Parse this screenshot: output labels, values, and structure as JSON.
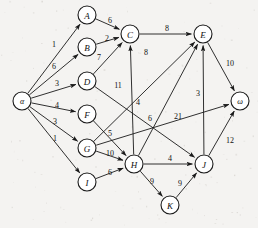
{
  "figure": {
    "background_color": "#f4f3f1",
    "ink_color": "#1a1a1a"
  },
  "chart_data": {
    "type": "diagram",
    "diagram_kind": "directed-weighted-graph",
    "title": "",
    "xlabel": "",
    "ylabel": "",
    "node_radius": 9,
    "nodes": [
      {
        "id": "alpha",
        "label": "α",
        "x": 22,
        "y": 101
      },
      {
        "id": "A",
        "label": "A",
        "x": 87,
        "y": 15
      },
      {
        "id": "B",
        "label": "B",
        "x": 87,
        "y": 47
      },
      {
        "id": "C",
        "label": "C",
        "x": 130,
        "y": 34
      },
      {
        "id": "D",
        "label": "D",
        "x": 87,
        "y": 81
      },
      {
        "id": "E",
        "label": "E",
        "x": 203,
        "y": 34
      },
      {
        "id": "F",
        "label": "F",
        "x": 87,
        "y": 114
      },
      {
        "id": "G",
        "label": "G",
        "x": 87,
        "y": 148
      },
      {
        "id": "H",
        "label": "H",
        "x": 134,
        "y": 164
      },
      {
        "id": "I",
        "label": "I",
        "x": 87,
        "y": 182
      },
      {
        "id": "J",
        "label": "J",
        "x": 204,
        "y": 164
      },
      {
        "id": "K",
        "label": "K",
        "x": 170,
        "y": 205
      },
      {
        "id": "omega",
        "label": "ω",
        "x": 240,
        "y": 101
      }
    ],
    "edges": [
      {
        "from": "alpha",
        "to": "A",
        "weight": 1,
        "label_x": 54,
        "label_y": 44
      },
      {
        "from": "alpha",
        "to": "B",
        "weight": 6,
        "label_x": 54,
        "label_y": 66
      },
      {
        "from": "alpha",
        "to": "D",
        "weight": 3,
        "label_x": 57,
        "label_y": 83
      },
      {
        "from": "alpha",
        "to": "F",
        "weight": 4,
        "label_x": 57,
        "label_y": 105
      },
      {
        "from": "alpha",
        "to": "G",
        "weight": 3,
        "label_x": 55,
        "label_y": 121
      },
      {
        "from": "alpha",
        "to": "I",
        "weight": 1,
        "label_x": 55,
        "label_y": 138
      },
      {
        "from": "A",
        "to": "C",
        "weight": 6,
        "label_x": 110,
        "label_y": 20
      },
      {
        "from": "B",
        "to": "C",
        "weight": 2,
        "label_x": 107,
        "label_y": 38
      },
      {
        "from": "D",
        "to": "C",
        "weight": 7,
        "label_x": 99,
        "label_y": 57
      },
      {
        "from": "C",
        "to": "E",
        "weight": 8,
        "label_x": 167,
        "label_y": 28
      },
      {
        "from": "G",
        "to": "E",
        "weight": 8,
        "label_x": 146,
        "label_y": 52
      },
      {
        "from": "D",
        "to": "J",
        "weight": 11,
        "label_x": 118,
        "label_y": 85
      },
      {
        "from": "H",
        "to": "C",
        "weight": 4,
        "label_x": 138,
        "label_y": 102
      },
      {
        "from": "H",
        "to": "E",
        "weight": 6,
        "label_x": 150,
        "label_y": 118
      },
      {
        "from": "G",
        "to": "omega",
        "weight": 21,
        "label_x": 178,
        "label_y": 116
      },
      {
        "from": "E",
        "to": "omega",
        "weight": 10,
        "label_x": 230,
        "label_y": 63
      },
      {
        "from": "J",
        "to": "E",
        "weight": 3,
        "label_x": 198,
        "label_y": 93
      },
      {
        "from": "J",
        "to": "omega",
        "weight": 12,
        "label_x": 230,
        "label_y": 140
      },
      {
        "from": "F",
        "to": "H",
        "weight": 5,
        "label_x": 110,
        "label_y": 133
      },
      {
        "from": "G",
        "to": "H",
        "weight": 10,
        "label_x": 110,
        "label_y": 153
      },
      {
        "from": "I",
        "to": "H",
        "weight": 6,
        "label_x": 110,
        "label_y": 172
      },
      {
        "from": "H",
        "to": "J",
        "weight": 4,
        "label_x": 170,
        "label_y": 158
      },
      {
        "from": "H",
        "to": "K",
        "weight": 9,
        "label_x": 152,
        "label_y": 181
      },
      {
        "from": "K",
        "to": "J",
        "weight": 9,
        "label_x": 180,
        "label_y": 183
      }
    ]
  }
}
